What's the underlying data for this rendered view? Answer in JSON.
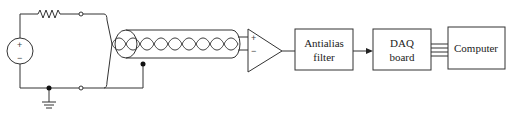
{
  "diagram": {
    "type": "signal-acquisition-block-diagram",
    "source": {
      "plus": "+",
      "minus": "−"
    },
    "amplifier": {
      "plus": "+",
      "minus": "−"
    },
    "blocks": [
      {
        "id": "antialias",
        "line1": "Antialias",
        "line2": "filter"
      },
      {
        "id": "daq",
        "line1": "DAQ",
        "line2": "board"
      },
      {
        "id": "computer",
        "line1": "Computer",
        "line2": ""
      }
    ],
    "connections": [
      "voltage source → resistor → top terminal",
      "voltage source → ground node → bottom terminal",
      "terminals → shielded twisted-pair cable → differential amplifier",
      "cable shield → ground return line",
      "amplifier → Antialias filter",
      "Antialias filter → DAQ board (arrow)",
      "DAQ board → Computer (4-line bus)"
    ],
    "colors": {
      "line": "#333333",
      "background": "#ffffff"
    }
  }
}
